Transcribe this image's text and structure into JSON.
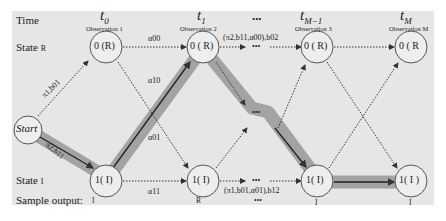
{
  "rows": {
    "time": "Time",
    "state_r": "State",
    "state_r_symbol": "R",
    "state_i": "State",
    "state_i_symbol": "I",
    "sample_output": "Sample output:"
  },
  "columns": [
    {
      "time": "t",
      "sub": "0",
      "observation": "Observation 1",
      "top_node": "0 (R)",
      "bottom_node": "1( I)",
      "output": "I"
    },
    {
      "time": "t",
      "sub": "1",
      "observation": "Observation 2",
      "top_node": "0 ( R)",
      "bottom_node": "1( I)",
      "output": "R"
    },
    {
      "time": "•••",
      "sub": "",
      "observation": "",
      "top_node": "•••",
      "bottom_node": "•••",
      "output": "•••"
    },
    {
      "time": "t",
      "sub": "M−1",
      "observation": "Observation 3",
      "top_node": "0 ( R)",
      "bottom_node": "1( I)",
      "output": "I"
    },
    {
      "time": "t",
      "sub": "M",
      "observation": "Observation M",
      "top_node": "0 ( R",
      "bottom_node": "1( I )",
      "output": "I"
    }
  ],
  "start_node": "Start",
  "edges": {
    "start_to_r": "π1,b01",
    "start_to_i": "π2,b11",
    "a00": "α00",
    "a10": "α10",
    "a01": "α01",
    "a11": "α11",
    "top_mid": "(π2,b11,α00),b02",
    "bottom_mid": "(π1,b01,α01),b12"
  },
  "colors": {
    "panel": "#e6e6e6",
    "highlight_path": "#a8a8a8",
    "node_fill": "#eeeeee",
    "stroke": "#333333"
  }
}
